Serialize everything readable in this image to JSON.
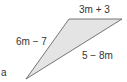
{
  "question_label": "a",
  "triangle": {
    "fill": "#e4e4e4",
    "stroke": "#555555",
    "vertices": [
      [
        69,
        19
      ],
      [
        122,
        19
      ],
      [
        26,
        79
      ]
    ],
    "sides": {
      "top": "3m + 3",
      "left": "6m − 7",
      "right": "5 − 8m"
    }
  }
}
